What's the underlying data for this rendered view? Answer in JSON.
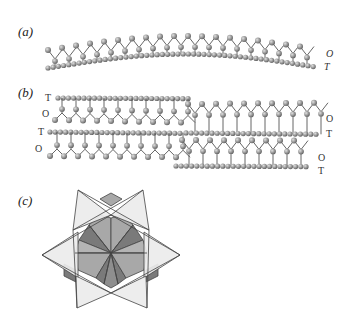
{
  "figure": {
    "panels": [
      {
        "id": "a",
        "label": "(a)",
        "description": "Curved T-O layer (single sheet pair)",
        "sheet_labels": {
          "octahedral": "O",
          "tetrahedral": "T"
        }
      },
      {
        "id": "b",
        "label": "(b)",
        "description": "Stacked offset T-O layers with reversals",
        "sheet_labels": {
          "left": [
            "T",
            "O",
            "T",
            "O"
          ],
          "right": [
            "O",
            "T",
            "O",
            "T"
          ]
        }
      },
      {
        "id": "c",
        "label": "(c)",
        "description": "Polyhedral arrangement: six-pointed star of triangles over hexagonal rhombi"
      }
    ],
    "colors": {
      "atom": "#9a9a9a",
      "atom_dark": "#6e6e6e",
      "bond": "#555555",
      "poly_light": "#ebebeb",
      "poly_mid": "#a8a8a8",
      "poly_dark": "#7a7a7a",
      "poly_edge": "#444444"
    }
  }
}
